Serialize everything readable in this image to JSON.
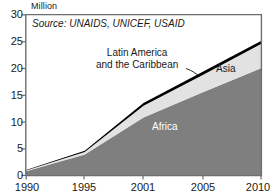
{
  "chart_data": {
    "type": "area",
    "title": "",
    "subtitle": "",
    "xlabel": "",
    "ylabel": "Million",
    "ylim": [
      0,
      30
    ],
    "yticks": [
      0,
      5,
      10,
      15,
      20,
      25,
      30
    ],
    "xticks": [
      "1990",
      "1995",
      "2001",
      "2005",
      "2010"
    ],
    "x": [
      1990,
      1995,
      2001,
      2005,
      2010
    ],
    "grid": false,
    "legend_position": "inline-annotations",
    "stacked": true,
    "series": [
      {
        "name": "Africa",
        "color": "#7f7f7f",
        "label_color": "#ffffff",
        "values": [
          0.8,
          3.9,
          10.8,
          15.5,
          20.0
        ]
      },
      {
        "name": "Asia",
        "color": "#e2e2e2",
        "label_color": "#1a1a1a",
        "values": [
          0.15,
          0.5,
          2.2,
          3.2,
          4.5
        ]
      },
      {
        "name": "Latin America and the Caribbean",
        "color": "#000000",
        "label_color": "#1a1a1a",
        "values": [
          0.1,
          0.2,
          0.5,
          0.6,
          0.6
        ]
      }
    ],
    "cumulative_totals": [
      1.05,
      4.6,
      13.5,
      19.3,
      25.1
    ],
    "annotations": [
      {
        "name": "source-note",
        "text": "Source: UNAIDS, UNICEF, USAID",
        "style": "italic"
      },
      {
        "name": "label-latam",
        "text": "Latin America\nand the Caribbean",
        "leader_line": true
      },
      {
        "name": "label-asia",
        "text": "Asia"
      },
      {
        "name": "label-africa",
        "text": "Africa"
      }
    ]
  },
  "axis": {
    "y_unit_caption": "Million",
    "y_tick_labels": [
      "30",
      "25",
      "20",
      "15",
      "10",
      "5",
      "0"
    ],
    "x_tick_labels": [
      "1990",
      "1995",
      "2001",
      "2005",
      "2010"
    ]
  },
  "labels": {
    "source_note": "Source: UNAIDS, UNICEF, USAID",
    "latam_line1": "Latin America",
    "latam_line2": "and the Caribbean",
    "asia": "Asia",
    "africa": "Africa"
  },
  "colors": {
    "africa": "#7f7f7f",
    "asia": "#e2e2e2",
    "latam": "#000000",
    "frame": "#6e6e6e",
    "text": "#1a1a1a",
    "background": "#ffffff"
  }
}
